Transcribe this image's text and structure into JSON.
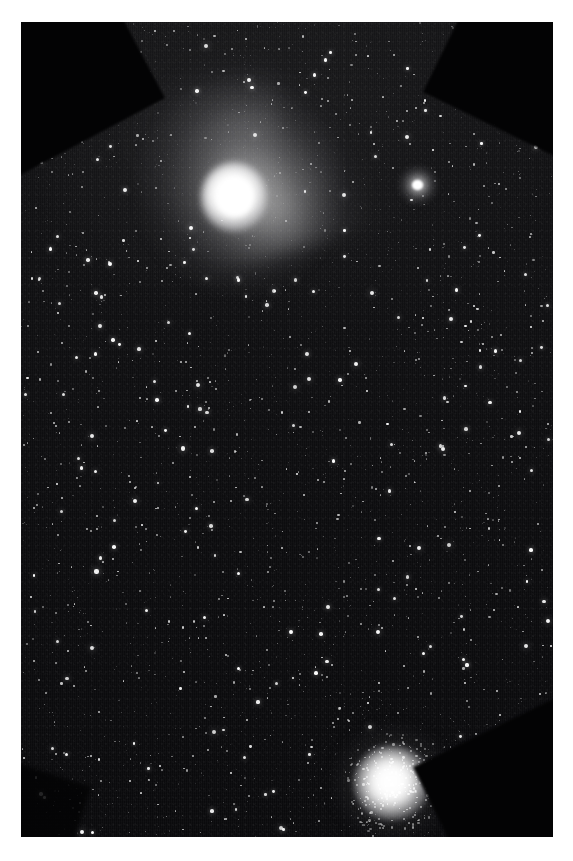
{
  "image": {
    "domain": "natural-image",
    "subject": "astrophotograph",
    "caption": "",
    "canvas": {
      "width": 573,
      "height": 861
    },
    "border": {
      "color": "#ffffff",
      "width_px": 21
    },
    "plate": {
      "left": 21,
      "top": 22,
      "width": 532,
      "height": 815,
      "background_color": "#0a0a0c",
      "texture": "vertical-scanlines"
    }
  },
  "objects": [
    {
      "id": "comet",
      "name": "comet",
      "label": "Comet with bright coma and broad diffuse dust tail",
      "center": {
        "x": 229,
        "y": 192
      },
      "coma_diameter_px": 42,
      "color": "#ffffff",
      "tail_direction": "upper-left",
      "tail_length_px": 230
    },
    {
      "id": "globular-cluster",
      "name": "globular-cluster",
      "label": "Globular star cluster with granular resolved core",
      "center": {
        "x": 372,
        "y": 763
      },
      "core_diameter_px": 30,
      "halo_diameter_px": 70,
      "color": "#ffffff"
    },
    {
      "id": "fuzzy-star",
      "name": "fuzzy-star",
      "label": "Bright fuzzy star / compact nebulous object",
      "center": {
        "x": 418,
        "y": 185
      },
      "diameter_px": 14,
      "color": "#ffffff"
    }
  ],
  "vignettes": [
    {
      "name": "corner-vignette-top-left",
      "corner": "top-left"
    },
    {
      "name": "corner-vignette-top-right",
      "corner": "top-right"
    },
    {
      "name": "corner-vignette-bottom-right",
      "corner": "bottom-right"
    },
    {
      "name": "corner-vignette-bottom-left",
      "corner": "bottom-left"
    }
  ],
  "starfield": {
    "name": "star-field",
    "label": "Dense field of faint background stars",
    "star_count": 2300,
    "color": "#ffffff",
    "density": "very-high",
    "seed": 20240117
  },
  "palette": {
    "sky": "#0a0a0c",
    "sky_bright": "#1e1e20",
    "star": "#ffffff",
    "vignette": "#030304",
    "border": "#ffffff"
  }
}
